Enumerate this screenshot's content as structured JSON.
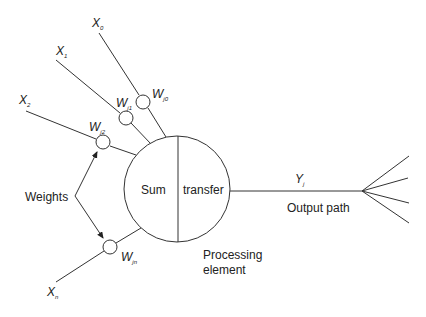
{
  "diagram": {
    "type": "artificial-neuron (processing element)",
    "inputs": [
      {
        "label": "X",
        "sub": "0",
        "weight": {
          "label": "W",
          "sub": "j0"
        }
      },
      {
        "label": "X",
        "sub": "1",
        "weight": {
          "label": "W",
          "sub": "j1"
        }
      },
      {
        "label": "X",
        "sub": "2",
        "weight": {
          "label": "W",
          "sub": "j2"
        }
      },
      {
        "label": "X",
        "sub": "n",
        "weight": {
          "label": "W",
          "sub": "jn"
        }
      }
    ],
    "weights_label": "Weights",
    "node": {
      "left_label": "Sum",
      "right_label": "transfer",
      "caption_line1": "Processing",
      "caption_line2": "element"
    },
    "output": {
      "label": "Y",
      "sub": "j",
      "caption": "Output path",
      "fan_out_count": 4
    }
  },
  "colors": {
    "stroke": "#333333",
    "text": "#222222",
    "background": "#ffffff"
  }
}
